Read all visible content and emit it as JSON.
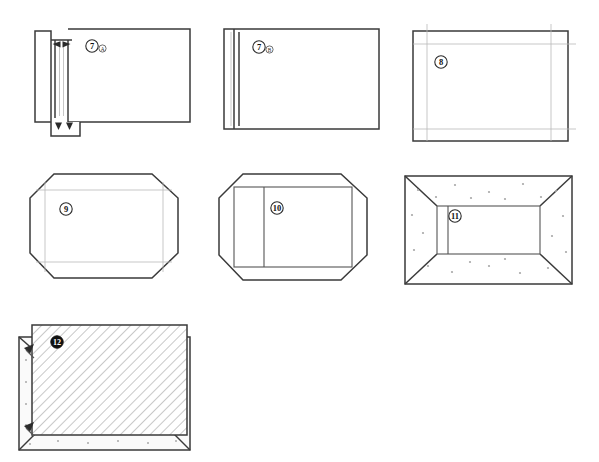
{
  "sheet": {
    "width": 599,
    "height": 462,
    "background": "#ffffff",
    "style": "line-art technical assembly diagram",
    "line_color": "#3a3a3a",
    "faint_line_color": "#b9b9b9",
    "speckle_color": "#a8a8a8",
    "hatch_color": "#9a9a9a"
  },
  "panels": [
    {
      "id": "panel-7a",
      "callout": "7",
      "callout_suffix": "A",
      "callout_style": "outline",
      "row": 1,
      "column": 1,
      "shape": "rectangle-with-left-edge-channel-detail",
      "description": "Rectangular panel with a narrow vertical channel detail at the left edge; paired arrows point inward at the top and bottom of the channel.",
      "features": [
        "left-channel",
        "inward-arrows-top",
        "inward-arrows-bottom",
        "side-flange"
      ]
    },
    {
      "id": "panel-7b",
      "callout": "7",
      "callout_suffix": "B",
      "callout_style": "outline",
      "row": 1,
      "column": 2,
      "shape": "rectangle-with-left-strip",
      "description": "Rectangular panel with two close vertical lines near the left edge forming a narrow strip.",
      "features": [
        "left-narrow-strip",
        "double-vertical-line"
      ]
    },
    {
      "id": "panel-8",
      "callout": "8",
      "callout_suffix": "",
      "callout_style": "outline",
      "row": 1,
      "column": 3,
      "shape": "rectangle-with-inset-frame",
      "description": "Rectangular panel with a light grey inset frame line offset from each border edge.",
      "features": [
        "inset-frame",
        "top-inset-line",
        "bottom-inset-line",
        "left-inset-line",
        "right-inset-line"
      ]
    },
    {
      "id": "panel-9",
      "callout": "9",
      "callout_suffix": "",
      "callout_style": "outline",
      "row": 2,
      "column": 1,
      "shape": "octagon-chamfered-rectangle",
      "description": "Rectangle with all four corners chamfered into an octagon, containing a faint inner rectangular frame.",
      "features": [
        "chamfered-corners",
        "inner-faint-frame"
      ]
    },
    {
      "id": "panel-10",
      "callout": "10",
      "callout_suffix": "",
      "callout_style": "outline",
      "row": 2,
      "column": 2,
      "shape": "octagon-with-inner-rectangle",
      "description": "Chamfered octagon outline enclosing a solid inner rectangle that is split by a vertical divider near its left side.",
      "features": [
        "chamfered-corners",
        "inner-rectangle",
        "vertical-divider"
      ]
    },
    {
      "id": "panel-11",
      "callout": "11",
      "callout_suffix": "",
      "callout_style": "outline",
      "row": 2,
      "column": 3,
      "shape": "rectangle-with-mitred-border-band",
      "description": "Rectangle with a wide border band mitred at each corner; the band is filled with scattered grey speckle dots.",
      "features": [
        "mitred-corners",
        "border-band",
        "speckle-fill",
        "inner-rectangle"
      ]
    },
    {
      "id": "panel-12",
      "callout": "12",
      "callout_suffix": "",
      "callout_style": "solid",
      "row": 3,
      "column": 1,
      "shape": "hatched-panel-over-speckled-base",
      "description": "Diagonally hatched rectangular panel seated on and offset from a speckled base tray; arrow markers at the left indicate the seating direction.",
      "features": [
        "diagonal-hatch",
        "speckled-base",
        "offset-overlay",
        "seating-arrows",
        "mitred-base-corner"
      ]
    }
  ]
}
